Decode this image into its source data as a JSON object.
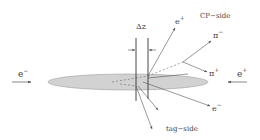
{
  "diagram": {
    "labels": {
      "delta_z": "Δz",
      "beam_left": "e",
      "beam_left_sup": "−",
      "beam_right": "e",
      "beam_right_sup": "+",
      "cp_side": "CP−side",
      "tag_side": "tag−side",
      "cp_eplus": "e",
      "cp_eplus_sup": "+",
      "pi_minus": "π",
      "pi_minus_sup": "−",
      "pi_plus": "π",
      "pi_plus_sup": "+",
      "tag_eminus": "e",
      "tag_eminus_sup": "−"
    },
    "colors": {
      "disk_fill": "#d2d2d2",
      "disk_stroke": "#9a9a9a",
      "line": "#555555",
      "text": "#444444"
    }
  }
}
